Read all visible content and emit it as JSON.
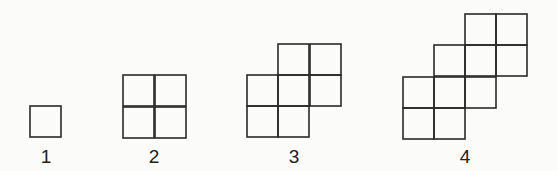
{
  "figures": [
    {
      "label": "1",
      "label_x": 46,
      "cells": [
        [
          30,
          106
        ]
      ]
    },
    {
      "label": "2",
      "label_x": 154,
      "cells": [
        [
          123,
          75
        ],
        [
          155,
          75
        ],
        [
          123,
          107
        ],
        [
          155,
          107
        ]
      ]
    },
    {
      "label": "3",
      "label_x": 294,
      "cells": [
        [
          278,
          44
        ],
        [
          310,
          44
        ],
        [
          247,
          75
        ],
        [
          278,
          75
        ],
        [
          310,
          75
        ],
        [
          247,
          106
        ],
        [
          278,
          106
        ]
      ]
    },
    {
      "label": "4",
      "label_x": 465,
      "cells": [
        [
          465,
          14
        ],
        [
          496,
          14
        ],
        [
          434,
          45
        ],
        [
          465,
          45
        ],
        [
          496,
          45
        ],
        [
          403,
          77
        ],
        [
          434,
          77
        ],
        [
          465,
          77
        ],
        [
          403,
          108
        ],
        [
          434,
          108
        ]
      ]
    }
  ],
  "cell_size": 31,
  "label_y": 163
}
